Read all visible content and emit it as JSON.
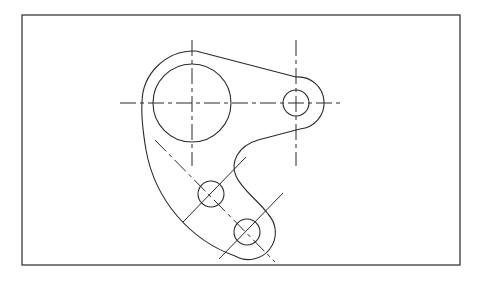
{
  "drawing": {
    "type": "orthographic-part-drawing",
    "description": "Mechanical link/lever plate with one large bore, one small boss hole and two small holes on an arc slot path, with centerlines",
    "colors": {
      "background": "#ffffff",
      "line": "#2a2a2a",
      "frame": "#3a3a3a"
    },
    "frame": {
      "x": 22,
      "y": 15,
      "width": 438,
      "height": 250
    },
    "features": {
      "large_bore": {
        "cx": 192,
        "cy": 103,
        "r": 39
      },
      "large_boss_arc": {
        "cx": 192,
        "cy": 103,
        "r": 52
      },
      "small_hole_right": {
        "cx": 296,
        "cy": 103,
        "r": 13
      },
      "small_boss_right": {
        "cx": 296,
        "cy": 103,
        "r": 26
      },
      "small_hole_1": {
        "cx": 211,
        "cy": 194,
        "r": 13
      },
      "small_hole_2": {
        "cx": 247,
        "cy": 232,
        "r": 13
      }
    }
  }
}
